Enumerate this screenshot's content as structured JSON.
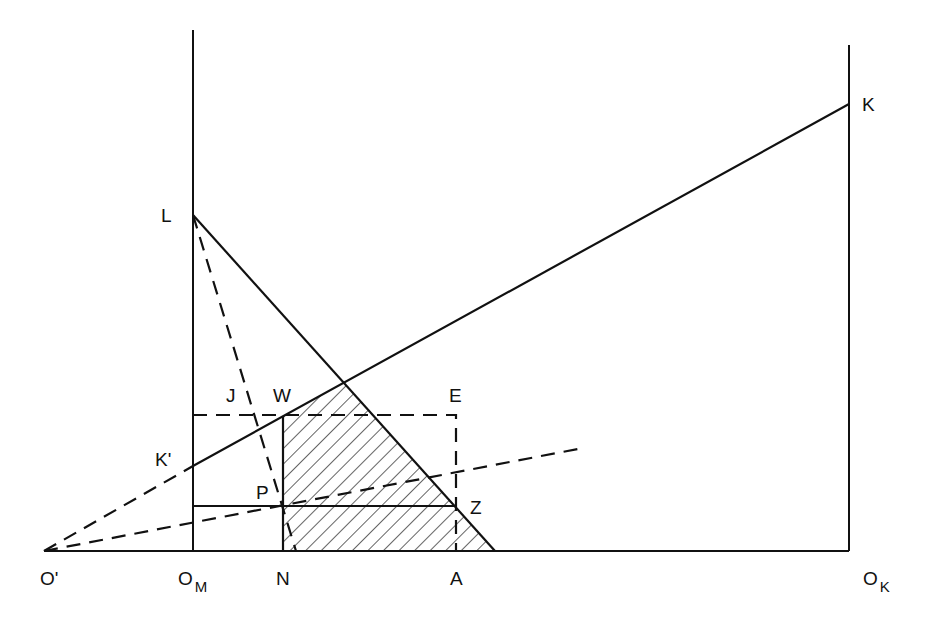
{
  "diagram": {
    "labels": {
      "K": "K",
      "L": "L",
      "K_prime": "K'",
      "J": "J",
      "W": "W",
      "E": "E",
      "P": "P",
      "Z": "Z",
      "O_prime": "O'",
      "O_M_main": "O",
      "O_M_sub": "M",
      "N": "N",
      "A": "A",
      "O_K_main": "O",
      "O_K_sub": "K"
    },
    "colors": {
      "ink": "#111111",
      "background": "#ffffff"
    }
  }
}
